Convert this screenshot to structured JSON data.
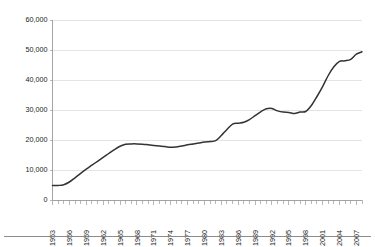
{
  "chart_data": {
    "type": "line",
    "title": "",
    "subtitle": "",
    "xlabel": "",
    "ylabel": "",
    "grid": "horizontal",
    "legend": "none",
    "ylim": [
      0,
      60000
    ],
    "xlim": [
      1953,
      2008
    ],
    "ytick_labels": [
      "0",
      "10,000",
      "20,000",
      "30,000",
      "40,000",
      "50,000",
      "60,000"
    ],
    "ytick_values": [
      0,
      10000,
      20000,
      30000,
      40000,
      50000,
      60000
    ],
    "xtick_labels": [
      "1953",
      "1956",
      "1959",
      "1962",
      "1965",
      "1968",
      "1971",
      "1974",
      "1977",
      "1980",
      "1983",
      "1986",
      "1989",
      "1992",
      "1995",
      "1998",
      "2001",
      "2004",
      "2007"
    ],
    "xtick_values": [
      1953,
      1956,
      1959,
      1962,
      1965,
      1968,
      1971,
      1974,
      1977,
      1980,
      1983,
      1986,
      1989,
      1992,
      1995,
      1998,
      2001,
      2004,
      2007
    ],
    "xtick_label_rotation": -90,
    "minor_xticks_every": 1,
    "series": [
      {
        "name": "Series 1",
        "color": "#333333",
        "x": [
          1953,
          1954,
          1955,
          1956,
          1957,
          1958,
          1959,
          1960,
          1961,
          1962,
          1963,
          1964,
          1965,
          1966,
          1967,
          1968,
          1969,
          1970,
          1971,
          1972,
          1973,
          1974,
          1975,
          1976,
          1977,
          1978,
          1979,
          1980,
          1981,
          1982,
          1983,
          1984,
          1985,
          1986,
          1987,
          1988,
          1989,
          1990,
          1991,
          1992,
          1993,
          1994,
          1995,
          1996,
          1997,
          1998,
          1999,
          2000,
          2001,
          2002,
          2003,
          2004,
          2005,
          2006,
          2007,
          2008
        ],
        "values": [
          4800,
          4850,
          5100,
          6000,
          7400,
          8900,
          10300,
          11600,
          12900,
          14200,
          15500,
          16800,
          17900,
          18600,
          18700,
          18700,
          18600,
          18400,
          18200,
          18000,
          17800,
          17550,
          17700,
          18000,
          18400,
          18700,
          19000,
          19300,
          19500,
          19800,
          21500,
          23500,
          25300,
          25600,
          25900,
          26800,
          28100,
          29400,
          30400,
          30500,
          29700,
          29300,
          29200,
          28800,
          29300,
          29500,
          31500,
          34500,
          37800,
          41500,
          44400,
          46200,
          46400,
          46900,
          48600,
          49400
        ]
      }
    ]
  },
  "axes": {
    "y_axis_name": "value-axis",
    "x_axis_name": "year-axis"
  }
}
